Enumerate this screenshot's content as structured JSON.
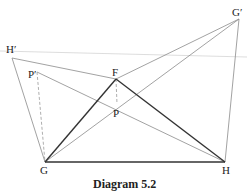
{
  "caption": "Diagram 5.2",
  "labels": {
    "H_prime": "H′",
    "G_prime": "G′",
    "F": "F",
    "P": "P",
    "P_prime": "P′",
    "G": "G",
    "H": "H"
  },
  "colors": {
    "thick_line": "#333333",
    "thin_line": "#8a8a8a",
    "faint_line": "#d0d0d0",
    "dashed_line": "#999999"
  }
}
